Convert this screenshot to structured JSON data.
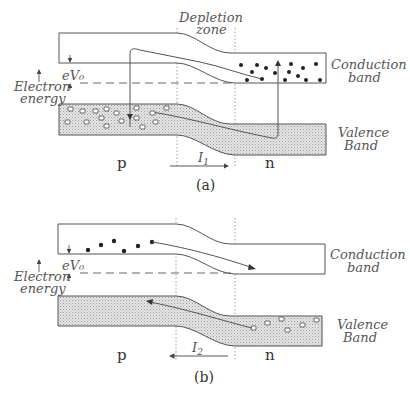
{
  "figure": {
    "panel_a": {
      "caption": "(a)",
      "depletion_label_line1": "Depletion",
      "depletion_label_line2": "zone",
      "conduction_label_line1": "Conduction",
      "conduction_label_line2": "band",
      "valence_label_line1": "Valence",
      "valence_label_line2": "Band",
      "energy_label_line1": "Electron",
      "energy_label_line2": "energy",
      "barrier_label": "eV₀",
      "p_label": "p",
      "n_label": "n",
      "current_label": "I",
      "current_subscript": "1",
      "current_direction": "right"
    },
    "panel_b": {
      "caption": "(b)",
      "conduction_label_line1": "Conduction",
      "conduction_label_line2": "band",
      "valence_label_line1": "Valence",
      "valence_label_line2": "Band",
      "energy_label_line1": "Electron",
      "energy_label_line2": "energy",
      "barrier_label": "eV₀",
      "p_label": "p",
      "n_label": "n",
      "current_label": "I",
      "current_subscript": "2",
      "current_direction": "left"
    },
    "colors": {
      "line": "#555555",
      "band_fill": "#d9d9d9",
      "dots": "#222222"
    }
  }
}
